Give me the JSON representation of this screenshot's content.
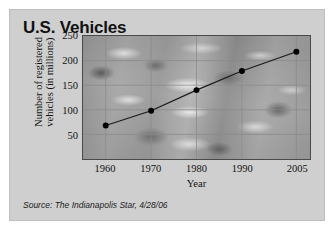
{
  "figure": {
    "title": "U.S. Vehicles",
    "source": "Source: The Indianapolis Star, 4/28/06",
    "background_color": "#cfcfcf",
    "border_color": "#bfbfbf"
  },
  "chart_data": {
    "type": "line",
    "title": "U.S. Vehicles",
    "xlabel": "Year",
    "ylabel": "Number of registered\nvehicles (in millions)",
    "categories": [
      "1960",
      "1970",
      "1980",
      "1990",
      "2005"
    ],
    "values": [
      68,
      98,
      140,
      179,
      218
    ],
    "series": [
      {
        "name": "Registered vehicles",
        "values": [
          68,
          98,
          140,
          179,
          218
        ]
      }
    ],
    "ylim": [
      0,
      250
    ],
    "yticks": [
      50,
      100,
      150,
      200,
      250
    ],
    "xticks": [
      "1960",
      "1970",
      "1980",
      "1990",
      "2005"
    ],
    "grid": true,
    "legend": "none",
    "line_color": "#1a1a1a",
    "marker": "circle",
    "marker_color": "#000000",
    "grid_color": "#8a8a8a",
    "axis_color": "#4a4a4a",
    "plot_background": "photo-traffic-aerial-grayscale",
    "annotations": []
  }
}
